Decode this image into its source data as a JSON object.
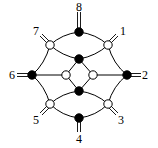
{
  "diagram": {
    "type": "molecular-graph",
    "colors": {
      "line": "#000000",
      "filled_node": "#000000",
      "open_node": "#ffffff"
    },
    "labels": {
      "l1": "1",
      "l2": "2",
      "l3": "3",
      "l4": "4",
      "l5": "5",
      "l6": "6",
      "l7": "7",
      "l8": "8"
    },
    "nodes": [
      {
        "id": "n8",
        "fill": "black",
        "terminal_label": "8"
      },
      {
        "id": "n1",
        "fill": "white",
        "terminal_label": "1"
      },
      {
        "id": "n2",
        "fill": "black",
        "terminal_label": "2"
      },
      {
        "id": "n3",
        "fill": "white",
        "terminal_label": "3"
      },
      {
        "id": "n4",
        "fill": "black",
        "terminal_label": "4"
      },
      {
        "id": "n5",
        "fill": "white",
        "terminal_label": "5"
      },
      {
        "id": "n6",
        "fill": "black",
        "terminal_label": "6"
      },
      {
        "id": "n7",
        "fill": "white",
        "terminal_label": "7"
      },
      {
        "id": "inner-top",
        "fill": "black"
      },
      {
        "id": "inner-bottom",
        "fill": "black"
      },
      {
        "id": "inner-left",
        "fill": "white"
      },
      {
        "id": "inner-right",
        "fill": "white"
      }
    ]
  }
}
